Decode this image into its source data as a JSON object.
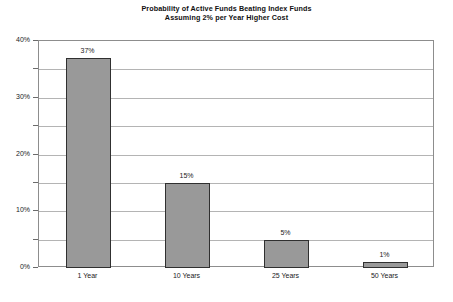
{
  "chart_data": {
    "type": "bar",
    "title": "Probability of Active Funds Beating Index Funds Assuming 2% per Year Higher Cost",
    "title_lines": [
      "Probability of Active Funds Beating Index Funds",
      "Assuming 2% per Year Higher Cost"
    ],
    "categories": [
      "1 Year",
      "10 Years",
      "25 Years",
      "50 Years"
    ],
    "values": [
      37,
      15,
      5,
      1
    ],
    "value_labels": [
      "37%",
      "15%",
      "5%",
      "1%"
    ],
    "xlabel": "",
    "ylabel": "",
    "ylim": [
      0,
      40
    ],
    "y_ticks": [
      0,
      5,
      10,
      15,
      20,
      25,
      30,
      35,
      40
    ],
    "y_tick_labels": [
      "0%",
      "",
      "10%",
      "",
      "20%",
      "",
      "30%",
      "",
      "40%"
    ],
    "y_major_labels": [
      "0%",
      "10%",
      "20%",
      "30%",
      "40%"
    ],
    "grid": true,
    "legend": false,
    "units": "percent",
    "colors": {
      "bar_fill": "#999999",
      "bar_border": "#303030",
      "gridline": "#b4b4b4",
      "plot_border": "#8d8d8d",
      "background": "#ffffff",
      "text": "#1a1a1a"
    }
  }
}
